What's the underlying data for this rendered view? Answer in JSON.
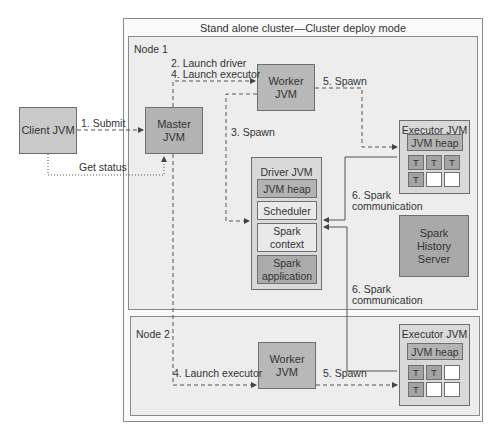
{
  "cluster": {
    "title": "Stand alone cluster—Cluster deploy mode"
  },
  "client": {
    "label": "Client JVM"
  },
  "node1": {
    "label": "Node 1",
    "master": {
      "line1": "Master",
      "line2": "JVM"
    },
    "worker": {
      "line1": "Worker",
      "line2": "JVM"
    },
    "driver": {
      "title": "Driver JVM",
      "components": [
        {
          "label": "JVM heap"
        },
        {
          "label": "Scheduler"
        },
        {
          "label": "Spark\ncontext"
        },
        {
          "label": "Spark\napplication"
        }
      ]
    },
    "executor": {
      "title": "Executor JVM",
      "heap": "JVM heap",
      "slots": [
        "T",
        "T",
        "T",
        "T",
        "",
        ""
      ]
    },
    "history": {
      "line1": "Spark",
      "line2": "History",
      "line3": "Server"
    }
  },
  "node2": {
    "label": "Node 2",
    "worker": {
      "line1": "Worker",
      "line2": "JVM"
    },
    "executor": {
      "title": "Executor JVM",
      "heap": "JVM heap",
      "slots": [
        "T",
        "T",
        "",
        "T",
        "",
        ""
      ]
    }
  },
  "edges": {
    "submit": "1. Submit",
    "get_status": "Get status",
    "launch_driver": "2. Launch driver",
    "launch_executor": "4. Launch executor",
    "spawn3": "3. Spawn",
    "spawn5": "5. Spawn",
    "comm_line1": "6. Spark",
    "comm_line2": "communication",
    "launch_executor_node2": "4. Launch executor",
    "spawn5_node2": "5. Spawn"
  },
  "colors": {
    "line": "#444444",
    "box_dark": "#b3b3b3",
    "box_light": "#e9e9e9"
  }
}
